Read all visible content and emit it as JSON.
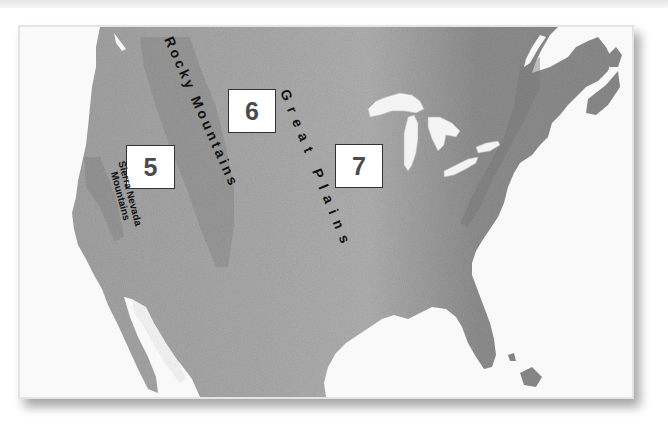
{
  "map": {
    "type": "shaded-relief map",
    "area": "United States and southern Canada / northern Mexico",
    "color_scheme": "grayscale",
    "colors": {
      "land": "#9a9a9a",
      "land_dark": "#7e7e7e",
      "water": "#f7f7f7",
      "label_box_border": "#333333",
      "label_number": "#4a4a4a",
      "label_text": "#111111"
    }
  },
  "regions": [
    {
      "id": "5",
      "number": "5",
      "name_label": "Sierra Nevada Mountains",
      "line1": "Sierra Nevada",
      "line2": "Mountains"
    },
    {
      "id": "6",
      "number": "6",
      "name_label": "Rocky Mountains"
    },
    {
      "id": "7",
      "number": "7",
      "name_label": "Great Plains"
    }
  ],
  "labels": {
    "rocky": "Rocky Mountains",
    "great_plains": "Great Plains",
    "sierra_line1": "Sierra Nevada",
    "sierra_line2": "Mountains"
  }
}
